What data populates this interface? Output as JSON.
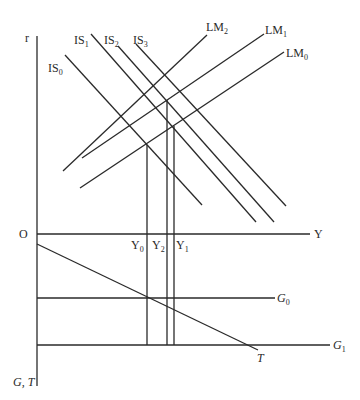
{
  "diagram": {
    "axes": {
      "r_label": "r",
      "origin_label": "O",
      "y_label": "Y",
      "gt_label": "G, T"
    },
    "is_curves": [
      {
        "name": "IS",
        "sub": "0"
      },
      {
        "name": "IS",
        "sub": "1"
      },
      {
        "name": "IS",
        "sub": "2"
      },
      {
        "name": "IS",
        "sub": "3"
      }
    ],
    "lm_curves": [
      {
        "name": "LM",
        "sub": "0"
      },
      {
        "name": "LM",
        "sub": "1"
      },
      {
        "name": "LM",
        "sub": "2"
      }
    ],
    "income_levels": [
      {
        "name": "Y",
        "sub": "0"
      },
      {
        "name": "Y",
        "sub": "2"
      },
      {
        "name": "Y",
        "sub": "1"
      }
    ],
    "government_lines": [
      {
        "name": "G",
        "sub": "0"
      },
      {
        "name": "G",
        "sub": "1"
      }
    ],
    "tax_label": "T"
  }
}
